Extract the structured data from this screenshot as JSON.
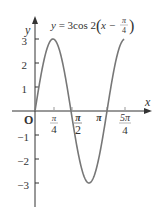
{
  "chart_data": {
    "type": "line",
    "equation": {
      "prefix": "y = 3cos 2",
      "inner": "x −",
      "frac_num": "π",
      "frac_den": "4"
    },
    "xlabel": "x",
    "ylabel": "y",
    "origin_label": "O",
    "x_ticks": [
      {
        "value": 0.7854,
        "num": "π",
        "den": "4"
      },
      {
        "value": 1.5708,
        "num": "π",
        "den": "2"
      },
      {
        "value": 3.1416,
        "num": "π",
        "den": ""
      },
      {
        "value": 3.927,
        "num": "5π",
        "den": "4"
      }
    ],
    "y_ticks": [
      "3",
      "2",
      "1",
      "−1",
      "−2",
      "−3"
    ],
    "y_tick_values": [
      3,
      2,
      1,
      -1,
      -2,
      -3
    ],
    "xlim": [
      0,
      3.93
    ],
    "ylim": [
      -3,
      3
    ],
    "curve_color": "#777777",
    "points": [
      {
        "x": 0,
        "y": 0
      },
      {
        "x": 0.7854,
        "y": 3
      },
      {
        "x": 1.5708,
        "y": 0
      },
      {
        "x": 2.3562,
        "y": -3
      },
      {
        "x": 3.1416,
        "y": 0
      },
      {
        "x": 3.927,
        "y": 3
      }
    ]
  }
}
